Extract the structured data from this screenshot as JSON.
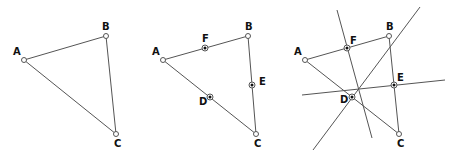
{
  "diagram": {
    "panels": [
      {
        "id": "triangle",
        "vertices": [
          {
            "label": "A",
            "x": 24,
            "y": 60,
            "lx": 13,
            "ly": 55
          },
          {
            "label": "B",
            "x": 106,
            "y": 36,
            "lx": 102,
            "ly": 30
          },
          {
            "label": "C",
            "x": 116,
            "y": 134,
            "lx": 114,
            "ly": 147
          }
        ]
      },
      {
        "id": "midpoints",
        "vertices": [
          {
            "label": "A",
            "x": 163,
            "y": 60,
            "lx": 152,
            "ly": 55
          },
          {
            "label": "B",
            "x": 248,
            "y": 36,
            "lx": 245,
            "ly": 30
          },
          {
            "label": "C",
            "x": 256,
            "y": 134,
            "lx": 254,
            "ly": 147
          }
        ],
        "midpoints": [
          {
            "label": "F",
            "x": 205,
            "y": 48,
            "lx": 202,
            "ly": 42
          },
          {
            "label": "E",
            "x": 252,
            "y": 85,
            "lx": 259,
            "ly": 85
          },
          {
            "label": "D",
            "x": 210,
            "y": 97,
            "lx": 199,
            "ly": 105
          }
        ]
      },
      {
        "id": "perpendicular-bisectors",
        "vertices": [
          {
            "label": "A",
            "x": 305,
            "y": 60,
            "lx": 294,
            "ly": 55
          },
          {
            "label": "B",
            "x": 389,
            "y": 36,
            "lx": 386,
            "ly": 30
          },
          {
            "label": "C",
            "x": 399,
            "y": 134,
            "lx": 397,
            "ly": 147
          }
        ],
        "midpoints": [
          {
            "label": "F",
            "x": 347,
            "y": 48,
            "lx": 350,
            "ly": 44
          },
          {
            "label": "E",
            "x": 394,
            "y": 85,
            "lx": 397,
            "ly": 81
          },
          {
            "label": "D",
            "x": 352,
            "y": 97,
            "lx": 340,
            "ly": 103
          }
        ],
        "bisectors": [
          {
            "name": "bisector-through-F",
            "x1": 337,
            "y1": 10,
            "x2": 372,
            "y2": 138
          },
          {
            "name": "bisector-through-D",
            "x1": 313,
            "y1": 150,
            "x2": 420,
            "y2": 7
          },
          {
            "name": "bisector-through-E",
            "x1": 302,
            "y1": 95,
            "x2": 445,
            "y2": 80
          }
        ]
      }
    ],
    "colors": {
      "line": "#555555",
      "point_fill": "#ffffff",
      "midpoint_dot": "#111111",
      "label": "#111111"
    }
  }
}
